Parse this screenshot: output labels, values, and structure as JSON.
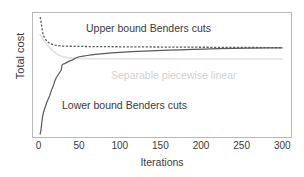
{
  "chart_data": {
    "type": "line",
    "title": "",
    "xlabel": "Iterations",
    "ylabel": "Total cost",
    "xlim": [
      -8,
      312
    ],
    "ylim": [
      0,
      100
    ],
    "xticks": [
      0,
      50,
      100,
      150,
      200,
      250,
      300
    ],
    "xticklabels": [
      "0",
      "50",
      "100",
      "150",
      "200",
      "250",
      "300"
    ],
    "yticks": [],
    "yticklabels": [],
    "grid": false,
    "legend": "none",
    "annotations": [
      {
        "name": "upper-bound-label",
        "text": "Upper bound Benders cuts",
        "x": 70,
        "y": 88,
        "color": "#3a3a3a"
      },
      {
        "name": "lower-bound-label",
        "text": "Lower bound Benders cuts",
        "x": 40,
        "y": 27,
        "color": "#3a3a3a"
      },
      {
        "name": "separable-label",
        "text": "Separable piecewise linear",
        "x": 100,
        "y": 50,
        "color": "#d2d2d2"
      }
    ],
    "series": [
      {
        "name": "Upper bound Benders cuts",
        "style": "dashed",
        "color": "#5a5a5a",
        "x": [
          2,
          3,
          4,
          5,
          6,
          7,
          8,
          9,
          10,
          12,
          14,
          16,
          18,
          20,
          24,
          28,
          32,
          40,
          50,
          60,
          80,
          100,
          120,
          150,
          180,
          210,
          240,
          270,
          300
        ],
        "y": [
          96,
          93,
          88,
          84,
          82,
          80,
          79,
          78,
          77,
          76,
          75,
          74.5,
          74,
          73.7,
          73.3,
          73,
          72.9,
          72.8,
          72.7,
          72.6,
          72.5,
          72.4,
          72.3,
          72.2,
          72.1,
          72.0,
          71.9,
          71.8,
          71.7
        ]
      },
      {
        "name": "Lower bound Benders cuts",
        "style": "solid",
        "color": "#5a5a5a",
        "x": [
          2,
          3,
          4,
          5,
          6,
          8,
          10,
          12,
          14,
          16,
          18,
          20,
          22,
          24,
          26,
          28,
          29,
          30,
          32,
          35,
          38,
          42,
          46,
          50,
          55,
          60,
          65,
          70,
          80,
          90,
          100,
          115,
          130,
          145,
          160,
          175,
          190,
          205,
          220,
          240,
          260,
          280,
          300
        ],
        "y": [
          3,
          6,
          12,
          17,
          20,
          24,
          28,
          31,
          34,
          38,
          41,
          45,
          48,
          50,
          52,
          54,
          58,
          58.5,
          59,
          60,
          61,
          62,
          63.5,
          64.5,
          65,
          65.5,
          66,
          66.3,
          67,
          67.5,
          68,
          68.5,
          69,
          69.3,
          69.7,
          70,
          70.3,
          70.6,
          70.9,
          71.1,
          71.3,
          71.5,
          71.6
        ]
      },
      {
        "name": "Separable piecewise linear",
        "style": "solid",
        "color": "#e2e2e2",
        "x": [
          2,
          6,
          10,
          14,
          18,
          22,
          26,
          30,
          36,
          42,
          50,
          60,
          75,
          90,
          110,
          130,
          155,
          180,
          210,
          240,
          270,
          300
        ],
        "y": [
          82,
          78,
          74.5,
          71.5,
          69,
          67,
          65.5,
          64.5,
          63.8,
          63.4,
          63.1,
          63.0,
          62.9,
          62.85,
          62.8,
          62.78,
          62.76,
          62.74,
          62.72,
          62.7,
          62.68,
          62.66
        ]
      }
    ]
  }
}
